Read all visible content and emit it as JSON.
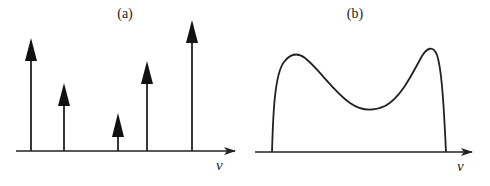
{
  "panels": [
    {
      "id": "a",
      "label": "(a)",
      "axis_label": "ν",
      "description": "Discrete line spectrum",
      "lines": [
        {
          "x": 31,
          "height": 113
        },
        {
          "x": 64,
          "height": 68
        },
        {
          "x": 118,
          "height": 38
        },
        {
          "x": 147,
          "height": 90
        },
        {
          "x": 192,
          "height": 131
        }
      ]
    },
    {
      "id": "b",
      "label": "(b)",
      "axis_label": "ν",
      "description": "Continuous spectrum with two peaks"
    }
  ],
  "colors": {
    "ink": "#222222",
    "background": "#ffffff"
  }
}
